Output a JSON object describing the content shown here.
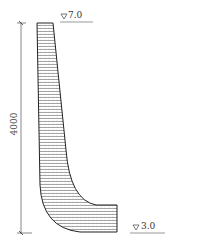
{
  "diagram": {
    "type": "retaining-wall-cross-section",
    "dimension": {
      "label": "4000",
      "orientation": "vertical"
    },
    "elevations": [
      {
        "symbol": "▽",
        "value": "7.0",
        "position": "top"
      },
      {
        "symbol": "▽",
        "value": "3.0",
        "position": "bottom"
      }
    ],
    "colors": {
      "line": "#333333",
      "hatch": "#555555",
      "background": "#ffffff"
    }
  }
}
